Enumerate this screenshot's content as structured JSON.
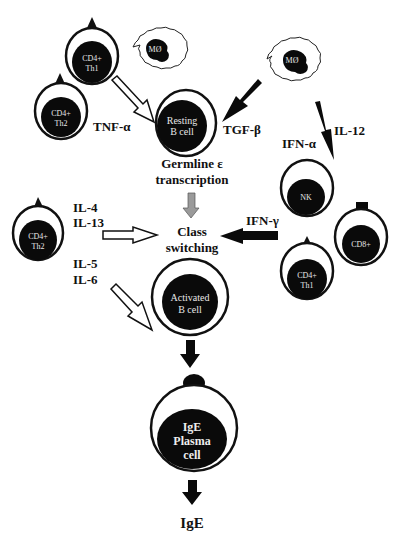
{
  "diagram": {
    "type": "IgE class switching pathway",
    "cells": {
      "th1_top": {
        "line1": "CD4+",
        "line2": "Th1"
      },
      "mo_left": {
        "label": "MØ"
      },
      "th2_top": {
        "line1": "CD4+",
        "line2": "Th2"
      },
      "resting_b": {
        "line1": "Resting",
        "line2": "B cell"
      },
      "mo_right": {
        "label": "MØ"
      },
      "th2_mid": {
        "line1": "CD4+",
        "line2": "Th2"
      },
      "nk": {
        "label": "NK"
      },
      "cd8": {
        "label": "CD8+"
      },
      "th1_right": {
        "line1": "CD4+",
        "line2": "Th1"
      },
      "activated_b": {
        "line1": "Activated",
        "line2": "B cell"
      },
      "plasma": {
        "line1": "IgE",
        "line2": "Plasma",
        "line3": "cell"
      }
    },
    "labels": {
      "tnf_alpha": "TNF-α",
      "tgf_beta": "TGF-β",
      "ifn_alpha": "IFN-α",
      "il12": "IL-12",
      "germline_1": "Germline ε",
      "germline_2": "transcription",
      "il4": "IL-4",
      "il13": "IL-13",
      "class_1": "Class",
      "class_2": "switching",
      "ifn_gamma": "IFN-γ",
      "il5": "IL-5",
      "il6": "IL-6",
      "ige": "IgE"
    },
    "colors": {
      "nucleus": "#0a0a0a",
      "outline": "#111111",
      "grey_arrow": "#9a9a9a",
      "background": "#ffffff"
    }
  }
}
